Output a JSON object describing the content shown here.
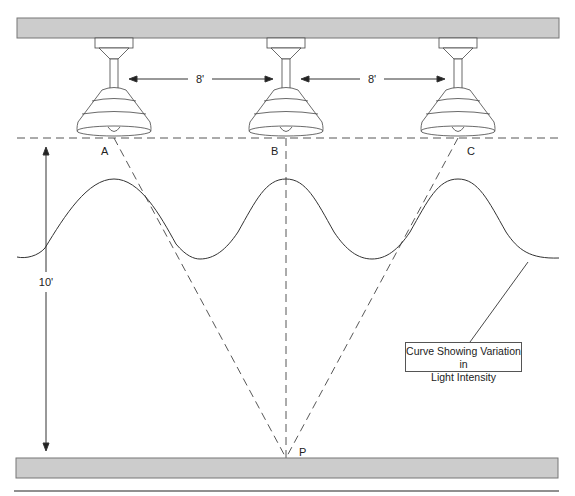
{
  "diagram": {
    "lamps": [
      {
        "label": "A",
        "x": 114
      },
      {
        "label": "B",
        "x": 286
      },
      {
        "label": "C",
        "x": 458
      }
    ],
    "spacing_labels": [
      "8'",
      "8'"
    ],
    "height_label": "10'",
    "point_label": "P",
    "callout": {
      "line1": "Curve Showing Variation in",
      "line2": "Light Intensity"
    },
    "colors": {
      "bar_fill": "#cccccc",
      "bar_stroke": "#777777",
      "line": "#333333"
    }
  }
}
